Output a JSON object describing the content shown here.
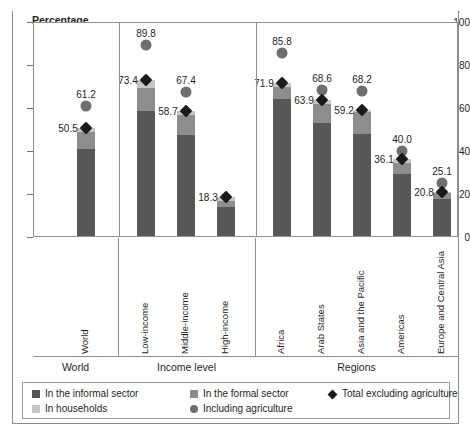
{
  "axis_title": "Percentage",
  "groups": [
    {
      "name": "World"
    },
    {
      "name": "Income level"
    },
    {
      "name": "Regions"
    }
  ],
  "legend": [
    {
      "key": "informal",
      "label": "In the informal sector",
      "marker": "square",
      "color": "#575757"
    },
    {
      "key": "formal",
      "label": "In the formal sector",
      "marker": "square",
      "color": "#8d8d8d"
    },
    {
      "key": "excl_agri",
      "label": "Total excluding agriculture",
      "marker": "diamond",
      "color": "#1a1a1a"
    },
    {
      "key": "household",
      "label": "In households",
      "marker": "square",
      "color": "#c6c6c6"
    },
    {
      "key": "incl_agri",
      "label": "Including agriculture",
      "marker": "circle",
      "color": "#6f6f6f"
    }
  ],
  "chart_data": {
    "type": "bar",
    "title": "",
    "subtitle": "",
    "xlabel": "",
    "ylabel": "Percentage",
    "ylim": [
      0,
      100
    ],
    "yticks": [
      0,
      20,
      40,
      60,
      80,
      100
    ],
    "grid": false,
    "legend_position": "bottom",
    "stacked": true,
    "categories": [
      "World",
      "Low-income",
      "Middle-income",
      "High-income",
      "Africa",
      "Arab States",
      "Asia and the Pacific",
      "Americas",
      "Europe and Central Asia"
    ],
    "groups": [
      {
        "name": "World",
        "categories": [
          "World"
        ]
      },
      {
        "name": "Income level",
        "categories": [
          "Low-income",
          "Middle-income",
          "High-income"
        ]
      },
      {
        "name": "Regions",
        "categories": [
          "Africa",
          "Arab States",
          "Asia and the Pacific",
          "Americas",
          "Europe and Central Asia"
        ]
      }
    ],
    "series": [
      {
        "name": "In the informal sector",
        "type": "bar-segment",
        "color": "#575757",
        "values": [
          40.8,
          58.8,
          47.3,
          13.4,
          64.5,
          52.9,
          48.0,
          29.1,
          17.4
        ]
      },
      {
        "name": "In the formal sector",
        "type": "bar-segment",
        "color": "#8d8d8d",
        "values": [
          7.9,
          10.6,
          9.7,
          3.1,
          5.4,
          9.0,
          10.1,
          5.4,
          2.9
        ]
      },
      {
        "name": "In households",
        "type": "bar-segment",
        "color": "#c6c6c6",
        "values": [
          1.8,
          4.0,
          1.7,
          1.8,
          2.0,
          2.0,
          1.1,
          1.6,
          0.5
        ]
      },
      {
        "name": "Total excluding agriculture",
        "type": "marker-diamond",
        "color": "#1a1a1a",
        "values": [
          50.5,
          73.4,
          58.7,
          18.3,
          71.9,
          63.9,
          59.2,
          36.1,
          20.8
        ]
      },
      {
        "name": "Including agriculture",
        "type": "marker-circle",
        "color": "#6f6f6f",
        "values": [
          61.2,
          89.8,
          67.4,
          null,
          85.8,
          68.6,
          68.2,
          40.0,
          25.1
        ]
      }
    ],
    "data_labels": {
      "diamond": [
        "50.5",
        "73.4",
        "58.7",
        "18.3",
        "71.9",
        "63.9",
        "59.2",
        "36.1",
        "20.8"
      ],
      "circle": [
        "61.2",
        "89.8",
        "67.4",
        null,
        "85.8",
        "68.6",
        "68.2",
        "40.0",
        "25.1"
      ]
    }
  },
  "labels": {
    "y_0": "0",
    "y_20": "20",
    "y_40": "40",
    "y_60": "60",
    "y_80": "80",
    "y_100": "100",
    "cat_0": "World",
    "cat_1": "Low-income",
    "cat_2": "Middle-income",
    "cat_3": "High-income",
    "cat_4": "Africa",
    "cat_5": "Arab States",
    "cat_6": "Asia and the Pacific",
    "cat_7": "Americas",
    "cat_8": "Europe and Central Asia",
    "grp_0": "World",
    "grp_1": "Income level",
    "grp_2": "Regions",
    "d_0": "50.5",
    "d_1": "73.4",
    "d_2": "58.7",
    "d_3": "18.3",
    "d_4": "71.9",
    "d_5": "63.9",
    "d_6": "59.2",
    "d_7": "36.1",
    "d_8": "20.8",
    "c_0": "61.2",
    "c_1": "89.8",
    "c_2": "67.4",
    "c_4": "85.8",
    "c_5": "68.6",
    "c_6": "68.2",
    "c_7": "40.0",
    "c_8": "25.1"
  }
}
